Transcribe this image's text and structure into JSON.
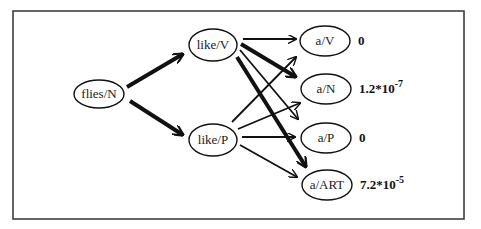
{
  "nodes": [
    {
      "id": "flies_N",
      "label": "flies/N"
    },
    {
      "id": "like_V",
      "label": "like/V"
    },
    {
      "id": "like_P",
      "label": "like/P"
    },
    {
      "id": "a_V",
      "label": "a/V",
      "probability": {
        "base": "0",
        "exponent": ""
      }
    },
    {
      "id": "a_N",
      "label": "a/N",
      "probability": {
        "base": "1.2*10",
        "exponent": "-7"
      }
    },
    {
      "id": "a_P",
      "label": "a/P",
      "probability": {
        "base": "0",
        "exponent": ""
      }
    },
    {
      "id": "a_ART",
      "label": "a/ART",
      "probability": {
        "base": "7.2*10",
        "exponent": "-5"
      }
    }
  ],
  "edges": [
    {
      "from": "flies_N",
      "to": "like_V",
      "weight": "thick"
    },
    {
      "from": "flies_N",
      "to": "like_P",
      "weight": "thick"
    },
    {
      "from": "like_V",
      "to": "a_V",
      "weight": "thin"
    },
    {
      "from": "like_V",
      "to": "a_N",
      "weight": "thick"
    },
    {
      "from": "like_V",
      "to": "a_P",
      "weight": "thin"
    },
    {
      "from": "like_V",
      "to": "a_ART",
      "weight": "thick"
    },
    {
      "from": "like_P",
      "to": "a_V",
      "weight": "thin"
    },
    {
      "from": "like_P",
      "to": "a_N",
      "weight": "thin"
    },
    {
      "from": "like_P",
      "to": "a_P",
      "weight": "thin"
    },
    {
      "from": "like_P",
      "to": "a_ART",
      "weight": "thin"
    }
  ]
}
